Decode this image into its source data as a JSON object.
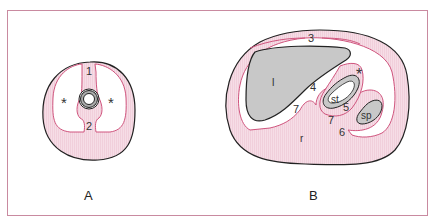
{
  "figure": {
    "panels": [
      {
        "id": "A",
        "label": "A",
        "markers": {
          "num1": "1",
          "num2": "2",
          "asterisk_left": "*",
          "asterisk_right": "*"
        }
      },
      {
        "id": "B",
        "label": "B",
        "markers": {
          "num3": "3",
          "num4": "4",
          "num5": "5",
          "num6": "6",
          "num7a": "7",
          "num7b": "7",
          "liver": "l",
          "stomach": "st",
          "spleen": "sp",
          "kidney_r": "r",
          "asterisk": "*"
        }
      }
    ],
    "colors": {
      "frame": "#c98aa0",
      "tissue_fill": "#f6dde6",
      "membrane_line": "#d0557e",
      "organ_fill": "#c8c8c8",
      "outline": "#222222"
    }
  }
}
